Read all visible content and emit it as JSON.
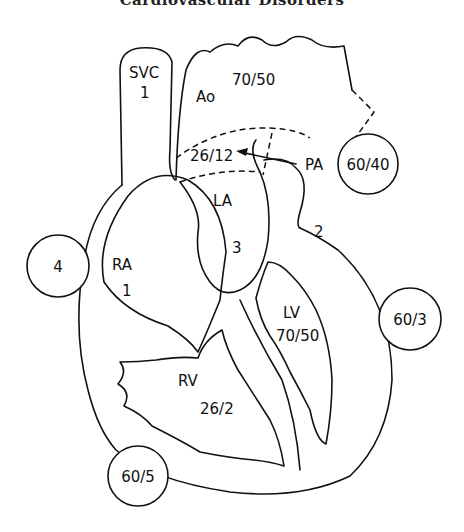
{
  "header": {
    "title": "Cardiovascular Disorders"
  },
  "diagram": {
    "chambers": {
      "svc": {
        "label": "SVC",
        "value": "1"
      },
      "ao": {
        "label": "Ao",
        "value": "70/50"
      },
      "pa": {
        "label": "PA",
        "value": "26/12"
      },
      "la": {
        "label": "LA",
        "value": "3"
      },
      "ra": {
        "label": "RA",
        "value": "1"
      },
      "lv": {
        "label": "LV",
        "value": "70/50"
      },
      "rv": {
        "label": "RV",
        "value": "26/2"
      }
    },
    "circled_normals": {
      "pa": "60/40",
      "ra": "4",
      "la": "2",
      "lv": "60/3",
      "rv": "60/5"
    }
  }
}
